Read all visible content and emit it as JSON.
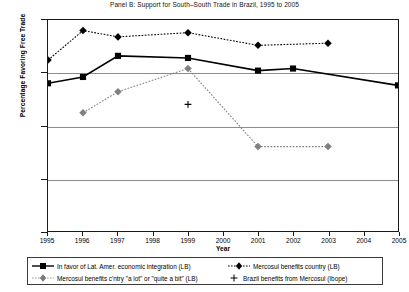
{
  "chart_data": {
    "type": "line",
    "title": "Panel B: Support for South–South Trade in Brazil, 1995 to 2005",
    "xlabel": "Year",
    "ylabel": "Percentage Favoring Free Trade",
    "xlim": [
      1995,
      2005
    ],
    "ylim": [
      0,
      100
    ],
    "grid": true,
    "legend_position": "below",
    "x": [
      1995,
      1996,
      1997,
      1998,
      1999,
      2000,
      2001,
      2002,
      2003,
      2004,
      2005
    ],
    "xtick_labels": [
      "1995",
      "1996",
      "1997",
      "1998",
      "1999",
      "2000",
      "2001",
      "2002",
      "2003",
      "2004",
      "2005"
    ],
    "ytick_labels": [
      "0%",
      "25%",
      "50%",
      "75%",
      "100%"
    ],
    "ytick_values": [
      0,
      25,
      50,
      75,
      100
    ],
    "series": [
      {
        "name": "In favor of Lat. Amer. economic integration (LB)",
        "marker": "square",
        "color": "#000000",
        "line": "solid",
        "points": [
          {
            "x": 1995,
            "y": 70
          },
          {
            "x": 1996,
            "y": 73
          },
          {
            "x": 1997,
            "y": 83
          },
          {
            "x": 1999,
            "y": 82
          },
          {
            "x": 2001,
            "y": 76
          },
          {
            "x": 2002,
            "y": 77
          },
          {
            "x": 2005,
            "y": 69
          }
        ]
      },
      {
        "name": "Mercosul benefits country (LB)",
        "marker": "diamond",
        "color": "#000000",
        "line": "dotted",
        "points": [
          {
            "x": 1995,
            "y": 81
          },
          {
            "x": 1996,
            "y": 95
          },
          {
            "x": 1997,
            "y": 92
          },
          {
            "x": 1999,
            "y": 94
          },
          {
            "x": 2001,
            "y": 88
          },
          {
            "x": 2003,
            "y": 89
          }
        ]
      },
      {
        "name": "Mercosul benefits c'ntry \"a lot\" or \"quite a bit\" (LB)",
        "marker": "diamond",
        "color": "#808080",
        "line": "dotted",
        "points": [
          {
            "x": 1996,
            "y": 56
          },
          {
            "x": 1997,
            "y": 66
          },
          {
            "x": 1999,
            "y": 77
          },
          {
            "x": 2001,
            "y": 40
          },
          {
            "x": 2003,
            "y": 40
          }
        ]
      },
      {
        "name": "Brazil benefits from Mercosul (Ibope)",
        "marker": "plus",
        "color": "#000000",
        "line": "none",
        "points": [
          {
            "x": 1999,
            "y": 60
          }
        ]
      }
    ]
  },
  "legend": {
    "items": [
      {
        "label": "In favor of Lat. Amer. economic integration (LB)"
      },
      {
        "label": "Mercosul benefits country (LB)"
      },
      {
        "label": "Mercosul benefits c'ntry \"a lot\" or \"quite a bit\" (LB)"
      },
      {
        "label": "Brazil benefits from Mercosul (Ibope)"
      }
    ]
  }
}
